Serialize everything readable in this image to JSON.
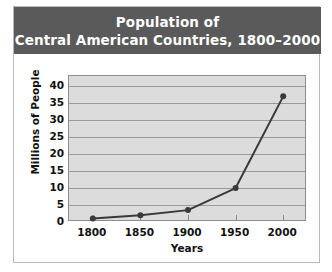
{
  "figure": {
    "title_lines": [
      "Population of",
      "Central American Countries, 1800–2000"
    ],
    "title_band_color": "#5a5a5a",
    "title_text_color": "#ffffff",
    "plot_background_color": "#dcdcdc",
    "gridline_color": "#9a9a9a",
    "border_color": "#8d8d8d",
    "series_color": "#3a3a3a"
  },
  "chart_data": {
    "type": "line",
    "title": "Population of Central American Countries, 1800–2000",
    "xlabel": "Years",
    "ylabel": "Millions of People",
    "categories": [
      "1800",
      "1850",
      "1900",
      "1950",
      "2000"
    ],
    "x": [
      1800,
      1850,
      1900,
      1950,
      2000
    ],
    "values": [
      1,
      2,
      3.5,
      10,
      37
    ],
    "series": [
      {
        "name": "Population",
        "values": [
          1,
          2,
          3.5,
          10,
          37
        ]
      }
    ],
    "xlim": [
      1775,
      2025
    ],
    "ylim": [
      0,
      43
    ],
    "ytick_labels": [
      "40",
      "35",
      "30",
      "25",
      "20",
      "15",
      "10",
      "5",
      "0"
    ],
    "ytick_values": [
      40,
      35,
      30,
      25,
      20,
      15,
      10,
      5,
      0
    ],
    "xtick_labels": [
      "1800",
      "1850",
      "1900",
      "1950",
      "2000"
    ],
    "grid": true,
    "grid_axis": "y",
    "legend": false,
    "legend_position": "none",
    "markers": "circle"
  }
}
